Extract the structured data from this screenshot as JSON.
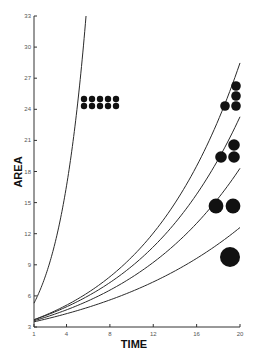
{
  "chart_data": {
    "type": "line",
    "title": "",
    "xlabel": "TIME",
    "ylabel": "AREA",
    "xlim": [
      1,
      20
    ],
    "ylim": [
      3,
      33
    ],
    "x_ticks": [
      1,
      4,
      8,
      12,
      16,
      20
    ],
    "y_ticks": [
      3,
      6,
      9,
      12,
      15,
      18,
      21,
      24,
      27,
      30,
      33
    ],
    "grid": false,
    "legend": "none",
    "series": [
      {
        "name": "curve-1 (steep)",
        "model": "exponential",
        "start": 5.3,
        "rate": 0.381,
        "x": [
          1,
          2,
          3,
          4,
          5,
          5.8
        ],
        "values": [
          5.3,
          7.8,
          11.3,
          16.6,
          24.3,
          33.0
        ]
      },
      {
        "name": "curve-2",
        "model": "exponential",
        "start": 3.7,
        "rate": 0.1074,
        "x": [
          1,
          4,
          8,
          12,
          16,
          20
        ],
        "values": [
          3.7,
          5.1,
          7.8,
          11.9,
          18.2,
          28.5
        ]
      },
      {
        "name": "curve-3",
        "model": "exponential",
        "start": 3.7,
        "rate": 0.0968,
        "x": [
          1,
          4,
          8,
          12,
          16,
          20
        ],
        "values": [
          3.7,
          4.9,
          7.3,
          10.7,
          15.8,
          23.3
        ]
      },
      {
        "name": "curve-4",
        "model": "exponential",
        "start": 3.6,
        "rate": 0.0856,
        "x": [
          1,
          4,
          8,
          12,
          16,
          20
        ],
        "values": [
          3.6,
          4.7,
          6.6,
          9.3,
          13.1,
          18.3
        ]
      },
      {
        "name": "curve-5",
        "model": "exponential",
        "start": 3.5,
        "rate": 0.0674,
        "x": [
          1,
          4,
          8,
          12,
          16,
          20
        ],
        "values": [
          3.5,
          4.3,
          5.6,
          7.3,
          9.6,
          12.6
        ]
      }
    ],
    "annotations": [
      {
        "name": "dot-grid-10",
        "description": "10 small dots (2 rows x 5) beside steep curve",
        "count": 10,
        "rows": 2,
        "cols": 5,
        "r": 3.2,
        "points": [
          [
            84,
            99
          ],
          [
            92,
            99
          ],
          [
            100,
            99
          ],
          [
            108,
            99
          ],
          [
            116,
            99
          ],
          [
            84,
            106
          ],
          [
            92,
            106
          ],
          [
            100,
            106
          ],
          [
            108,
            106
          ],
          [
            116,
            106
          ]
        ]
      },
      {
        "name": "dot-group-4",
        "description": "4 dots at end of curve-2",
        "count": 4,
        "r": 4.8,
        "points": [
          [
            236,
            86
          ],
          [
            236,
            96
          ],
          [
            236,
            106
          ],
          [
            225,
            106
          ]
        ]
      },
      {
        "name": "dot-group-3",
        "description": "3 dots at end of curve-3",
        "count": 3,
        "r": 5.8,
        "points": [
          [
            234,
            145
          ],
          [
            221,
            157
          ],
          [
            234,
            157
          ]
        ]
      },
      {
        "name": "dot-group-2",
        "description": "2 dots at end of curve-4",
        "count": 2,
        "r": 7.4,
        "points": [
          [
            216,
            206
          ],
          [
            233,
            206
          ]
        ]
      },
      {
        "name": "dot-group-1",
        "description": "1 large dot at end of curve-5",
        "count": 1,
        "r": 10,
        "points": [
          [
            230,
            257
          ]
        ]
      }
    ]
  },
  "layout": {
    "plot_left": 34,
    "plot_right": 240,
    "plot_top": 16,
    "plot_bottom": 327
  }
}
